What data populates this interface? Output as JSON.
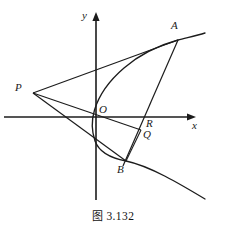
{
  "figure": {
    "caption_cjk": "图",
    "caption_number": "3.132",
    "type": "geometry-diagram",
    "stroke_color": "#1c1c1c",
    "background_color": "#ffffff"
  },
  "axes": {
    "x_label": "x",
    "y_label": "y",
    "origin_label": "O",
    "origin_px": [
      96,
      117
    ],
    "x_axis_from_px": [
      4,
      117
    ],
    "x_axis_to_px": [
      196,
      117
    ],
    "y_axis_from_px": [
      96,
      200
    ],
    "y_axis_to_px": [
      96,
      13
    ]
  },
  "points": [
    {
      "name": "A",
      "label": "A",
      "px": [
        178,
        40
      ],
      "label_px": [
        172,
        24
      ]
    },
    {
      "name": "P",
      "label": "P",
      "px": [
        33,
        93
      ],
      "label_px": [
        17,
        84
      ]
    },
    {
      "name": "O",
      "label": "O",
      "px": [
        96,
        117
      ],
      "label_px": [
        99,
        104
      ]
    },
    {
      "name": "R",
      "label": "R",
      "px": [
        144,
        117
      ],
      "label_px": [
        145,
        117
      ]
    },
    {
      "name": "Q",
      "label": "Q",
      "px": [
        140,
        129
      ],
      "label_px": [
        143,
        129
      ]
    },
    {
      "name": "B",
      "label": "B",
      "px": [
        126,
        161
      ],
      "label_px": [
        119,
        166
      ]
    }
  ],
  "curve": {
    "kind": "parabola",
    "opens": "right",
    "description": "rightward-opening parabola with vertex near the origin passing through A and B"
  },
  "segments": [
    {
      "from": "P",
      "to": "A",
      "kind": "straight"
    },
    {
      "from": "P",
      "to": "B",
      "kind": "straight"
    },
    {
      "from": "P",
      "to": "Q",
      "through": "O",
      "kind": "straight"
    },
    {
      "from": "A",
      "to": "B",
      "through": "R",
      "kind": "straight"
    },
    {
      "from": "Q",
      "to": "B",
      "kind": "straight"
    }
  ]
}
